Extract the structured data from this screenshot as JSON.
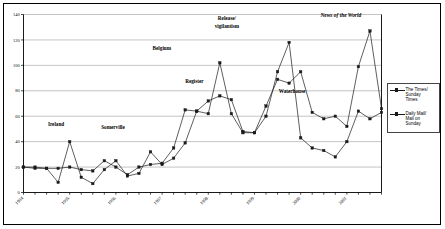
{
  "chart_data": {
    "type": "line",
    "title": "",
    "xlabel": "",
    "ylabel": "",
    "ylim": [
      0,
      140
    ],
    "yticks": [
      0,
      20,
      40,
      60,
      80,
      100,
      120,
      140
    ],
    "grid": true,
    "legend_position": "right",
    "x": [
      "1994 Q1",
      "1994 Q2",
      "1994 Q3",
      "1994 Q4",
      "1995 Q1",
      "1995 Q2",
      "1995 Q3",
      "1995 Q4",
      "1996 Q1",
      "1996 Q2",
      "1996 Q3",
      "1996 Q4",
      "1997 Q1",
      "1997 Q2",
      "1997 Q3",
      "1997 Q4",
      "1998 Q1",
      "1998 Q2",
      "1998 Q3",
      "1998 Q4",
      "1999 Q1",
      "1999 Q2",
      "1999 Q3",
      "1999 Q4",
      "2000 Q1",
      "2000 Q2",
      "2000 Q3",
      "2000 Q4",
      "2001 Q1",
      "2001 Q2",
      "2001 Q3",
      "2001 Q4"
    ],
    "xtick_labels": [
      "1994",
      "1995",
      "1996",
      "1997",
      "1998",
      "1999",
      "2000",
      "2001"
    ],
    "xtick_indices": [
      0,
      4,
      8,
      12,
      16,
      20,
      24,
      28
    ],
    "series": [
      {
        "name": "The Times/ Sunday Times",
        "values": [
          20,
          20,
          19,
          8,
          40,
          12,
          7,
          18,
          25,
          13,
          15,
          32,
          22,
          27,
          39,
          64,
          62,
          102,
          62,
          47,
          47,
          60,
          95,
          118,
          43,
          35,
          33,
          28,
          40,
          64,
          58,
          63
        ]
      },
      {
        "name": "Daily Mail/ Mail on Sunday",
        "values": [
          20,
          19,
          19,
          19,
          20,
          18,
          17,
          25,
          20,
          14,
          20,
          22,
          23,
          35,
          65,
          64,
          72,
          76,
          73,
          48,
          47,
          68,
          89,
          86,
          95,
          63,
          58,
          60,
          52,
          99,
          127,
          66
        ]
      }
    ],
    "annotations": [
      {
        "text": "Ireland",
        "x_index": 4,
        "y": 52,
        "style": "bold"
      },
      {
        "text": "Somerville",
        "x_index": 11,
        "y": 50,
        "style": "bold"
      },
      {
        "text": "Belgium",
        "x_index": 17,
        "y": 112,
        "style": "bold"
      },
      {
        "text": "Register",
        "x_index": 21,
        "y": 86,
        "style": "bold"
      },
      {
        "text": "Release/",
        "x_index": 25,
        "y": 136,
        "style": "bold"
      },
      {
        "text": "vigilantism",
        "x_index": 25,
        "y": 129,
        "style": "bold"
      },
      {
        "text": "Waterhouse",
        "x_index": 33,
        "y": 78,
        "style": "bold"
      },
      {
        "text": "News of the World",
        "x_index": 39,
        "y": 138,
        "style": "italic"
      }
    ]
  },
  "legend": {
    "entries": [
      {
        "label": "The Times/\nSunday\nTimes",
        "marker": "square-marker"
      },
      {
        "label": "Daily Mail/\nMail on\nSunday",
        "marker": "square-marker"
      }
    ]
  },
  "colors": {
    "series_line": "#1a1a1a",
    "gridline": "#a9a9a9",
    "axis": "#000000",
    "background": "#ffffff"
  }
}
